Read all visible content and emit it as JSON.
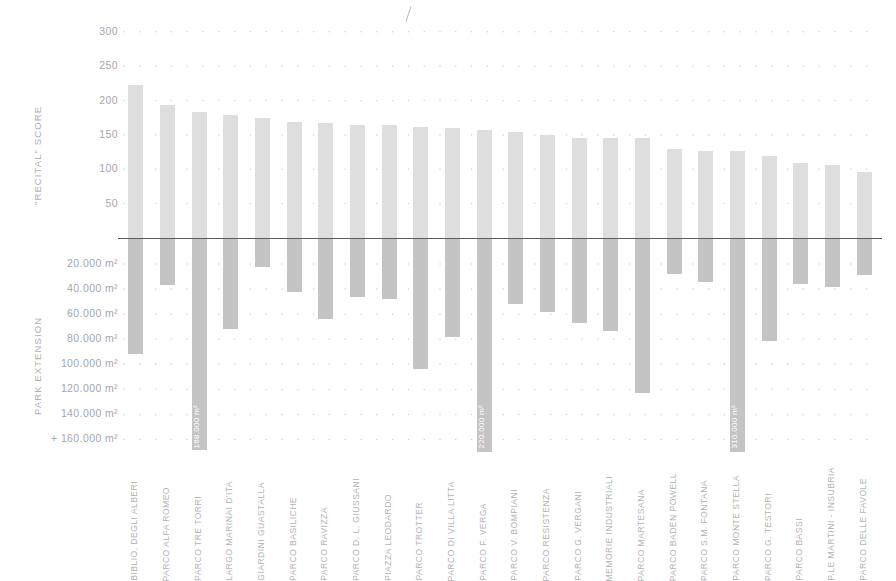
{
  "chart_data": {
    "type": "bar",
    "title": "",
    "orientation": "vertical-diverging",
    "grid": "dotted",
    "legend": "none",
    "top_axis": {
      "ylabel": "\"RECITAL\" SCORE",
      "ticks": [
        300,
        250,
        200,
        150,
        100,
        50
      ],
      "tick_labels": [
        "300",
        "250",
        "200",
        "150",
        "100",
        "50"
      ],
      "ylim": [
        0,
        320
      ]
    },
    "bottom_axis": {
      "ylabel": "PARK EXTENSION",
      "tick_labels": [
        "20.000 m²",
        "40.000 m²",
        "60.000 m²",
        "80.000 m²",
        "100.000 m²",
        "120.000 m²",
        "140.000 m²",
        "+ 160.000 m²"
      ],
      "ticks": [
        20000,
        40000,
        60000,
        80000,
        100000,
        120000,
        140000,
        160000
      ],
      "ylim": [
        0,
        170000
      ]
    },
    "categories": [
      "BIBLIO. DEGLI ALBERI",
      "PARCO ALFA ROMEO",
      "PARCO TRE TORRI",
      "LARGO MARINAI D'ITA",
      "GIARDINI GUASTALLA",
      "PARCO BASILICHE",
      "PARCO RAVIZZA",
      "PARCO D. L. GIUSSANI",
      "PIAZZA LEODARDO",
      "PARCO TROTTER",
      "PARCO DI VILLA LITTA",
      "PARCO F. VERGA",
      "PARCO V. BOMPIANI",
      "PARCO  RESISTENZA",
      "PARCO G. VERGANI",
      "MEMORIE INDUSTRIALI",
      "PARCO MARTESANA",
      "PARCO BADEN POWELL",
      "PARCO S.M. FONTANA",
      "PARCO MONTE STELLA",
      "PARCO G. TESTORI",
      "PARCO BASSI",
      "P.LE MARTINI - INSUBRIA",
      "PARCO DELLE FAVOLE"
    ],
    "series": [
      {
        "name": "\"RECITAL\" SCORE",
        "axis": "top",
        "color": "#dedede",
        "values": [
          222,
          194,
          184,
          179,
          174,
          169,
          167,
          165,
          164,
          162,
          160,
          157,
          154,
          150,
          146,
          145,
          145,
          130,
          127,
          127,
          120,
          109,
          106,
          96
        ]
      },
      {
        "name": "PARK EXTENSION",
        "axis": "bottom",
        "color": "#c4c4c4",
        "values": [
          92000,
          37000,
          168000,
          72000,
          22000,
          42000,
          64000,
          46000,
          48000,
          104000,
          78000,
          220000,
          52000,
          58000,
          67000,
          73000,
          123000,
          28000,
          34000,
          310000,
          81000,
          36000,
          38000,
          29000
        ],
        "value_labels": {
          "2": "168.000 m²",
          "11": "220.000 m²",
          "19": "310.000 m²"
        }
      }
    ]
  }
}
